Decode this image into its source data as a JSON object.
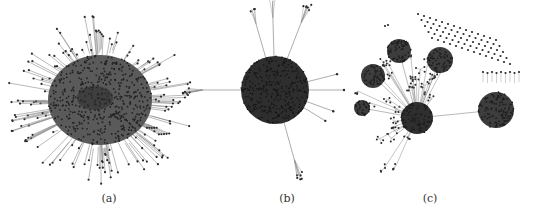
{
  "figure": {
    "panels": [
      {
        "id": "a",
        "label": "(a)",
        "description": "dense single-core network with radial periphery"
      },
      {
        "id": "b",
        "label": "(b)",
        "description": "dense spherical core with few peripheral tendrils"
      },
      {
        "id": "c",
        "label": "(c)",
        "description": "hub-and-cluster network with several communities and isolated nodes"
      }
    ],
    "colors": {
      "node": "#2a2a2a",
      "edge": "#8a8a8a",
      "core": "#3a3a3a",
      "background": "#ffffff"
    }
  }
}
